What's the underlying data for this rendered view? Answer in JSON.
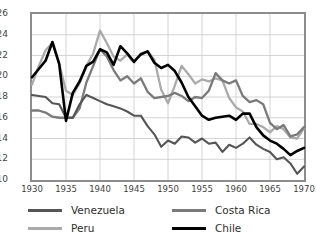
{
  "chart_data": {
    "type": "line",
    "title": "",
    "xlabel": "",
    "ylabel": "",
    "xlim": [
      1930,
      1970
    ],
    "ylim": [
      10,
      26
    ],
    "ytick_step": 2,
    "xtick_step": 5,
    "grid": true,
    "legend_position": "bottom",
    "yticks": [
      "26",
      "24",
      "22",
      "20",
      "18",
      "16",
      "14",
      "12",
      "10"
    ],
    "xticks": [
      "1930",
      "1935",
      "1940",
      "1945",
      "1950",
      "1955",
      "1960",
      "1965",
      "1970"
    ],
    "x": [
      1930,
      1931,
      1932,
      1933,
      1934,
      1935,
      1936,
      1937,
      1938,
      1939,
      1940,
      1941,
      1942,
      1943,
      1944,
      1945,
      1946,
      1947,
      1948,
      1949,
      1950,
      1951,
      1952,
      1953,
      1954,
      1955,
      1956,
      1957,
      1958,
      1959,
      1960,
      1961,
      1962,
      1963,
      1964,
      1965,
      1966,
      1967,
      1968,
      1969,
      1970
    ],
    "series": [
      {
        "name": "Venezuela",
        "color": "#555555",
        "width": 2.1,
        "values": [
          18.2,
          18.1,
          18.0,
          17.4,
          17.3,
          16.0,
          16.0,
          17.3,
          18.2,
          17.9,
          17.6,
          17.3,
          17.1,
          16.9,
          16.6,
          16.2,
          16.2,
          15.2,
          14.4,
          13.2,
          13.8,
          13.5,
          14.2,
          14.1,
          13.6,
          14.0,
          13.5,
          13.6,
          12.7,
          13.4,
          13.1,
          13.5,
          14.1,
          13.4,
          13.0,
          12.7,
          12.0,
          12.2,
          11.6,
          10.6,
          11.3
        ]
      },
      {
        "name": "Peru",
        "color": "#aaaaaa",
        "width": 2.3,
        "values": [
          19.2,
          21.0,
          22.5,
          23.2,
          21.2,
          18.6,
          18.2,
          19.3,
          21.0,
          22.2,
          24.4,
          23.2,
          21.9,
          21.5,
          22.1,
          21.3,
          22.2,
          22.4,
          21.6,
          18.7,
          17.4,
          19.1,
          21.0,
          20.2,
          19.3,
          19.7,
          19.5,
          19.8,
          19.6,
          17.9,
          17.0,
          16.6,
          15.4,
          15.4,
          15.1,
          14.6,
          15.2,
          14.9,
          14.1,
          14.0,
          15.0
        ]
      },
      {
        "name": "Costa Rica",
        "color": "#7a7a7a",
        "width": 2.3,
        "values": [
          16.7,
          16.7,
          16.5,
          16.1,
          16.0,
          16.0,
          16.0,
          16.9,
          19.4,
          21.0,
          22.6,
          21.9,
          20.6,
          19.6,
          20.0,
          19.3,
          19.8,
          18.5,
          17.9,
          18.0,
          18.1,
          18.4,
          18.1,
          17.6,
          18.0,
          17.9,
          18.6,
          20.3,
          19.6,
          19.3,
          19.6,
          18.1,
          17.5,
          17.7,
          17.3,
          15.5,
          14.9,
          15.3,
          14.2,
          14.4,
          15.1
        ]
      },
      {
        "name": "Chile",
        "color": "#000000",
        "width": 2.6,
        "values": [
          19.9,
          20.7,
          21.5,
          23.3,
          21.2,
          15.7,
          18.4,
          19.5,
          21.0,
          21.4,
          22.6,
          22.3,
          21.1,
          22.9,
          22.2,
          21.4,
          22.1,
          22.4,
          21.3,
          20.8,
          21.1,
          20.5,
          19.4,
          18.0,
          17.1,
          16.2,
          15.8,
          16.0,
          16.1,
          16.2,
          15.8,
          16.4,
          16.4,
          15.1,
          14.3,
          13.8,
          13.5,
          13.0,
          12.4,
          12.8,
          13.1
        ]
      }
    ]
  },
  "legend": {
    "items": [
      {
        "label": "Venezuela"
      },
      {
        "label": "Costa Rica"
      },
      {
        "label": "Peru"
      },
      {
        "label": "Chile"
      }
    ]
  }
}
